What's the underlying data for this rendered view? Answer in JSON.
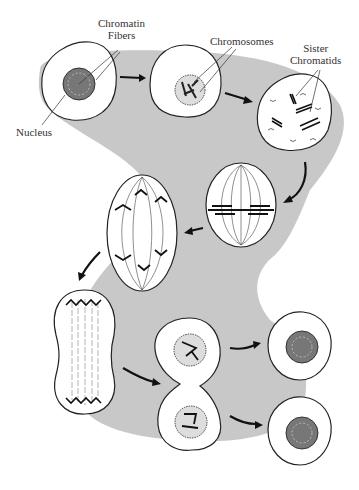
{
  "diagram": {
    "type": "mitosis-cycle",
    "background_color": "#c8c8c8",
    "labels": {
      "chromatin_fibers": "Chromatin\nFibers",
      "chromosomes": "Chromosomes",
      "sister_chromatids": "Sister\nChromatids",
      "nucleus": "Nucleus"
    },
    "stages": [
      {
        "id": "interphase",
        "desc": "Cell with nucleus containing chromatin fibers"
      },
      {
        "id": "prophase",
        "desc": "Chromosomes condense in nucleus"
      },
      {
        "id": "prometaphase",
        "desc": "Sister chromatids, nuclear envelope breaking"
      },
      {
        "id": "metaphase",
        "desc": "Chromosomes aligned at equator on spindle"
      },
      {
        "id": "anaphase",
        "desc": "Chromatids separate toward poles"
      },
      {
        "id": "telophase",
        "desc": "Cell elongated, chromatids at poles"
      },
      {
        "id": "cytokinesis",
        "desc": "Cell pinching into two with nuclei"
      },
      {
        "id": "daughter-cell-1",
        "desc": "Daughter cell with nucleus"
      },
      {
        "id": "daughter-cell-2",
        "desc": "Daughter cell with nucleus"
      }
    ]
  }
}
